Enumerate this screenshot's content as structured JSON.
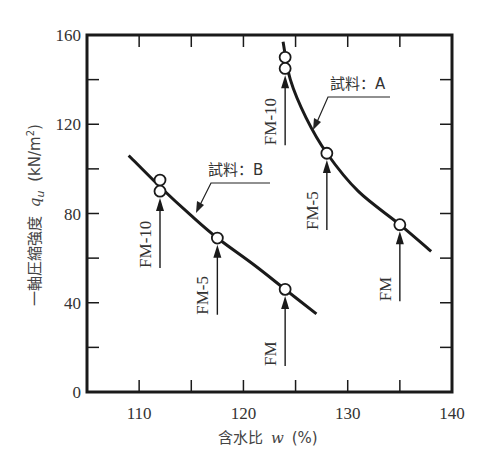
{
  "chart_data": {
    "type": "line",
    "title": "",
    "xlabel": "含水比 w (%)",
    "ylabel": "一軸圧縮強度 qu (kN/m²)",
    "xlim": [
      105,
      140
    ],
    "ylim": [
      0,
      160
    ],
    "x_ticks": [
      110,
      120,
      130,
      140
    ],
    "x_minor_ticks": [
      115,
      125,
      135
    ],
    "y_ticks": [
      0,
      40,
      80,
      120,
      160
    ],
    "y_minor_ticks": [
      20,
      60,
      100,
      140
    ],
    "grid": false,
    "legend": "none (inline annotations)",
    "series": [
      {
        "name": "試料：A",
        "points": [
          {
            "x": 124,
            "y": 150,
            "label": "FM-10"
          },
          {
            "x": 124,
            "y": 145,
            "label": "FM-10"
          },
          {
            "x": 128,
            "y": 107,
            "label": "FM-5"
          },
          {
            "x": 135,
            "y": 75,
            "label": "FM"
          }
        ],
        "curve": [
          [
            123.8,
            157
          ],
          [
            124.5,
            140
          ],
          [
            126,
            123
          ],
          [
            128,
            107
          ],
          [
            131,
            90
          ],
          [
            135,
            75
          ],
          [
            138,
            63
          ]
        ]
      },
      {
        "name": "試料：B",
        "points": [
          {
            "x": 112,
            "y": 95,
            "label": "FM-10"
          },
          {
            "x": 112,
            "y": 90,
            "label": "FM-10"
          },
          {
            "x": 117.5,
            "y": 69,
            "label": "FM-5"
          },
          {
            "x": 124,
            "y": 46,
            "label": "FM"
          }
        ],
        "curve": [
          [
            109,
            106
          ],
          [
            112,
            92
          ],
          [
            115,
            79
          ],
          [
            117.5,
            69
          ],
          [
            121,
            57
          ],
          [
            124,
            46
          ],
          [
            127,
            35
          ]
        ]
      }
    ],
    "annotations": [
      {
        "text": "試料：A",
        "target_series": "試料：A"
      },
      {
        "text": "試料：B",
        "target_series": "試料：B"
      },
      {
        "text": "FM-10",
        "x": 112,
        "arrow_to_y": 87
      },
      {
        "text": "FM-5",
        "x": 117.5,
        "arrow_to_y": 66
      },
      {
        "text": "FM",
        "x": 124,
        "arrow_to_y": 43
      },
      {
        "text": "FM-10",
        "x": 124,
        "arrow_to_y": 142
      },
      {
        "text": "FM-5",
        "x": 128,
        "arrow_to_y": 104
      },
      {
        "text": "FM",
        "x": 135,
        "arrow_to_y": 72
      }
    ]
  },
  "labels": {
    "y_axis_title": "一軸圧縮強度",
    "y_axis_symbol": "q",
    "y_axis_sub": "u",
    "y_axis_units": "(kN/m",
    "y_axis_sup": "2",
    "y_axis_close": ")",
    "x_axis_title": "含水比",
    "x_axis_symbol": "w",
    "x_axis_units": "(%)",
    "series_a": "試料：A",
    "series_b": "試料：B"
  }
}
